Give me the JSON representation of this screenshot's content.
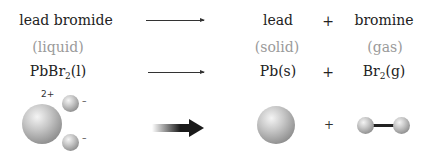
{
  "reaction": {
    "words": {
      "reactant": "lead bromide",
      "product1": "lead",
      "plus": "+",
      "product2": "bromine"
    },
    "states": {
      "reactant": "(liquid)",
      "product1": "(solid)",
      "product2": "(gas)"
    },
    "formulas": {
      "reactant_main": "PbBr",
      "reactant_sub": "2",
      "reactant_state": "(l)",
      "product1": "Pb(s)",
      "plus": "+",
      "product2_main": "Br",
      "product2_sub": "2",
      "product2_state": "(g)"
    },
    "models": {
      "cation_charge": "2+",
      "anion_charge_1": "–",
      "anion_charge_2": "–",
      "plus": "+"
    }
  },
  "colors": {
    "text": "#222222",
    "state_text": "#9a9a9a",
    "sphere": "#b0b0b0",
    "arrow": "#333333"
  }
}
